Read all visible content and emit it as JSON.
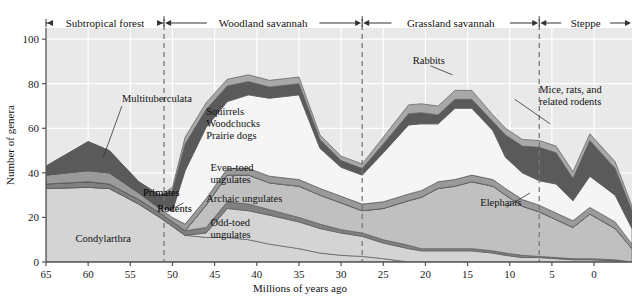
{
  "figure": {
    "background_color": "#e9e9e9",
    "grid_color": "#ffffff",
    "axis_color": "#555555",
    "divider_color": "#777777"
  },
  "axes": {
    "y_title": "Number of genera",
    "x_title": "Millions of years ago",
    "y_ticks": [
      "0",
      "20",
      "40",
      "60",
      "80",
      "100"
    ],
    "y_tick_values": [
      0,
      20,
      40,
      60,
      80,
      100
    ],
    "ylim": [
      0,
      105
    ],
    "x_ticks": [
      "65",
      "60",
      "55",
      "50",
      "45",
      "40",
      "35",
      "30",
      "25",
      "20",
      "15",
      "10",
      "5",
      "0"
    ],
    "x_tick_values": [
      65,
      60,
      55,
      50,
      45,
      40,
      35,
      30,
      25,
      20,
      15,
      10,
      5,
      0
    ],
    "xlim": [
      65,
      -4.5
    ],
    "x_reversed": true,
    "grid": true
  },
  "eras": [
    {
      "label": "Subtropical forest",
      "start": 65,
      "end": 51
    },
    {
      "label": "Woodland savannah",
      "start": 51,
      "end": 27.5
    },
    {
      "label": "Grassland savannah",
      "start": 27.5,
      "end": 6.5
    },
    {
      "label": "Steppe",
      "start": 6.5,
      "end": -4.5
    }
  ],
  "dividers": [
    51,
    27.5,
    6.5
  ],
  "annotations": [
    {
      "name": "multituberculata",
      "text": "Multituberculata",
      "x": 56,
      "y": 72,
      "leader": true
    },
    {
      "name": "primates",
      "text": "Primates",
      "x": 53.5,
      "y": 29.5,
      "leader": false
    },
    {
      "name": "rodents",
      "text": "Rodents",
      "x": 51.8,
      "y": 22.5,
      "leader": false
    },
    {
      "name": "condylarthra",
      "text": "Condylarthra",
      "x": 61.5,
      "y": 9,
      "leader": false
    },
    {
      "name": "squirrels-woodchucks-prairie-dogs",
      "text": "Squirrels\nWoodchucks\nPrairie dogs",
      "x": 46,
      "y": 66,
      "leader": false
    },
    {
      "name": "even-toed-ungulates",
      "text": "Even-toed\nungulates",
      "x": 45.5,
      "y": 41,
      "leader": false
    },
    {
      "name": "archaic-ungulates",
      "text": "Archaic ungulates",
      "x": 46,
      "y": 27,
      "leader": true
    },
    {
      "name": "odd-toed-ungulates",
      "text": "Odd-toed\nungulates",
      "x": 45.5,
      "y": 16,
      "leader": false
    },
    {
      "name": "rabbits",
      "text": "Rabbits",
      "x": 21.5,
      "y": 89,
      "leader": true
    },
    {
      "name": "mice-rats-related-rodents",
      "text": "Mice, rats, and\nrelated rodents",
      "x": 6.5,
      "y": 76,
      "leader": true
    },
    {
      "name": "elephants",
      "text": "Elephants",
      "x": 13.5,
      "y": 25,
      "leader": true
    }
  ],
  "chart_data": {
    "type": "area",
    "title": "",
    "xlabel": "Millions of years ago",
    "ylabel": "Number of genera",
    "xlim": [
      65,
      -4.5
    ],
    "ylim": [
      0,
      105
    ],
    "grid": true,
    "legend": "inline annotations",
    "stacked": true,
    "x": [
      65,
      60,
      57.5,
      54,
      51.5,
      50,
      48.5,
      46,
      43.5,
      41,
      38.5,
      35,
      32.5,
      30,
      27.5,
      25,
      22,
      20.5,
      18.5,
      16.5,
      14.5,
      12,
      10.5,
      8.5,
      6.5,
      4.5,
      2.5,
      0.5,
      -2.5,
      -4.5
    ],
    "series": [
      {
        "name": "Condylarthra",
        "fill": "#d4d4d4",
        "values": [
          33,
          33.5,
          33,
          26,
          20,
          16,
          12,
          11,
          11,
          10,
          8,
          6,
          4,
          3,
          2.5,
          1.5,
          0,
          0,
          0,
          0,
          0,
          0,
          0,
          0,
          0,
          0,
          0,
          0,
          0,
          0
        ]
      },
      {
        "name": "Odd-toed ungulates",
        "fill": "#d4d4d4",
        "values": [
          0,
          0,
          0,
          0,
          0,
          0,
          0,
          2,
          13,
          13,
          13,
          12,
          11,
          10,
          9,
          7,
          6,
          5,
          5,
          5,
          5,
          4,
          3,
          2,
          2,
          1.5,
          1,
          1,
          0.5,
          0
        ]
      },
      {
        "name": "Archaic ungulates",
        "fill": "#808080",
        "values": [
          2,
          2.5,
          2,
          2,
          2,
          2,
          2,
          2.5,
          3,
          3,
          2.5,
          2,
          2,
          1.5,
          1.5,
          1.5,
          1.5,
          1,
          1,
          1,
          1,
          1,
          1,
          1,
          0.5,
          0.5,
          0.5,
          0.5,
          0.5,
          0
        ]
      },
      {
        "name": "Even-toed ungulates",
        "fill": "#c0c0c0",
        "values": [
          0,
          0,
          0,
          0,
          0,
          0,
          0,
          10,
          12,
          13,
          12,
          14,
          13,
          12,
          10,
          14,
          20,
          23,
          27,
          28,
          30,
          29,
          26,
          22,
          20,
          17,
          14,
          20,
          14,
          6
        ]
      },
      {
        "name": "Elephants",
        "fill": "#cccccc",
        "values": [
          0,
          0,
          0,
          0,
          0,
          0,
          0,
          0,
          0,
          0,
          0,
          0,
          0,
          0,
          0,
          0,
          0,
          0,
          0,
          0,
          0,
          0,
          0,
          0,
          0,
          0,
          0,
          0,
          0,
          0
        ]
      },
      {
        "name": "Rodents",
        "fill": "#9a9a9a",
        "values": [
          4,
          5,
          5,
          3,
          2,
          2,
          3,
          3,
          3,
          3,
          3,
          3,
          3,
          3,
          3,
          3,
          3,
          3,
          3,
          3,
          3,
          3,
          3,
          3,
          3,
          3,
          3,
          3,
          3,
          2
        ]
      },
      {
        "name": "Squirrels Woodchucks Prairie dogs",
        "fill": "#f5f5f5",
        "values": [
          0,
          0,
          0,
          0,
          0,
          3,
          24,
          32,
          30,
          33,
          35,
          38,
          18,
          13,
          13,
          22,
          31,
          30,
          26,
          32,
          30,
          22,
          14,
          12,
          11,
          13,
          9,
          14,
          12,
          7
        ]
      },
      {
        "name": "Mice, rats, and related rodents",
        "fill": "#5a5a5a",
        "values": [
          4,
          13,
          10,
          5,
          6,
          9,
          12,
          8,
          7,
          6,
          5,
          5,
          4,
          3,
          3,
          4,
          5,
          5,
          4,
          4,
          4,
          4,
          10,
          12,
          15,
          14,
          10,
          16,
          12,
          8
        ]
      },
      {
        "name": "Rabbits",
        "fill": "#a8a8a8",
        "values": [
          0,
          0,
          0,
          0,
          0,
          1.5,
          3,
          3,
          3,
          3,
          3,
          3,
          2,
          2,
          2,
          3,
          4,
          4,
          4,
          4,
          4,
          3,
          3,
          3,
          3,
          3,
          3,
          3,
          3,
          2
        ]
      }
    ]
  }
}
